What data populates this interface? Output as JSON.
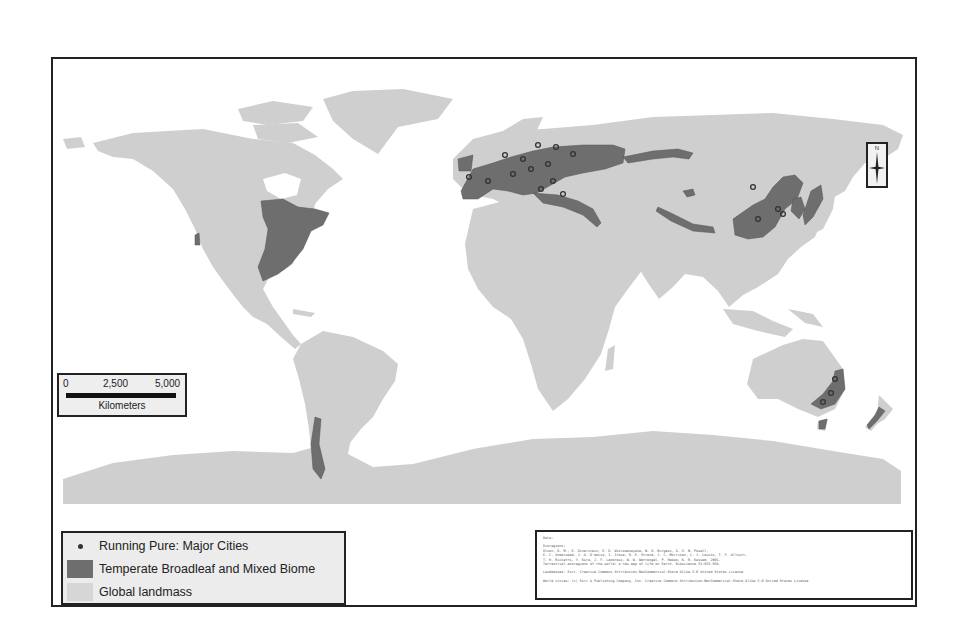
{
  "map": {
    "colors": {
      "landmass": "#cfcfcf",
      "biome": "#6e6e6e",
      "city": "#333333",
      "ocean": "#ffffff",
      "frame": "#222222"
    },
    "biome_regions": [
      "Eastern North America",
      "Pacific Northwest",
      "Southern Chile",
      "Europe",
      "Caucasus / Anatolia",
      "Central Asia mountains",
      "Eastern China",
      "Korea",
      "Japan",
      "Southeastern Australia",
      "Tasmania",
      "New Zealand"
    ]
  },
  "scale_bar": {
    "ticks": [
      "0",
      "2,500",
      "5,000"
    ],
    "unit": "Kilometers"
  },
  "north_arrow": {
    "label": "N"
  },
  "legend": {
    "items": [
      {
        "symbol": "dot",
        "label": "Running Pure: Major Cities"
      },
      {
        "symbol": "dark-fill",
        "label": "Temperate Broadleaf and Mixed Biome"
      },
      {
        "symbol": "light-fill",
        "label": "Global landmass"
      }
    ]
  },
  "credits": {
    "lines": [
      "Data:",
      "",
      "Ecoregions:",
      "Olson, D. M., E. Dinerstein, E. D. Wikramanayake, N. D. Burgess, G. V. N. Powell,",
      "E. C. Underwood, J. A. D'amico, I. Itoua, H. E. Strand, J. C. Morrison, C. J. Loucks, T. F. Allnutt,",
      "T. H. Ricketts, Y. Kura, J. F. Lamoreux, W. W. Wettengel, P. Hedao, K. R. Kassem. 2001.",
      "Terrestrial ecoregions of the world: a new map of life on Earth. Bioscience 51:933-938.",
      "",
      "Landmasses: Esri. Creative Commons Attribution-NonCommercial-Share Alike 3.0 United States License",
      "",
      "World cities: (c) Esri & Publishing Company, Inc. Creative Commons Attribution-NonCommercial-Share Alike 3.0 United States License"
    ]
  }
}
